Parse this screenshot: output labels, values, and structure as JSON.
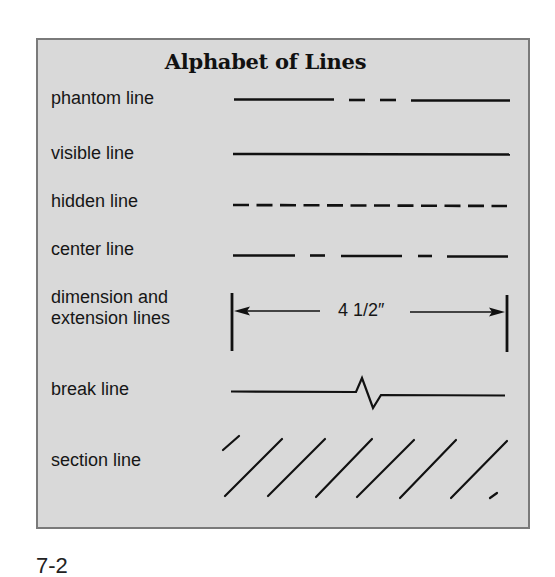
{
  "figure": {
    "title": "Alphabet of Lines",
    "caption": "7-2",
    "colors": {
      "panel_background": "#d9d9d9",
      "panel_border": "#7a7a7a",
      "line_ink": "#111111"
    },
    "rows": [
      {
        "id": "phantom",
        "label": "phantom line",
        "style": "long-short-short-long dashes"
      },
      {
        "id": "visible",
        "label": "visible line",
        "style": "solid"
      },
      {
        "id": "hidden",
        "label": "hidden line",
        "style": "evenly dashed (12 dashes)"
      },
      {
        "id": "center",
        "label": "center line",
        "style": "long-short-long-short-long"
      },
      {
        "id": "dimension",
        "label_line1": "dimension and",
        "label_line2": "extension lines",
        "style": "arrows between extension lines",
        "dimension_value": "4 1/2″"
      },
      {
        "id": "break",
        "label": "break line",
        "style": "straight with zig-zag"
      },
      {
        "id": "section",
        "label": "section line",
        "style": "parallel diagonal hatching"
      }
    ]
  }
}
